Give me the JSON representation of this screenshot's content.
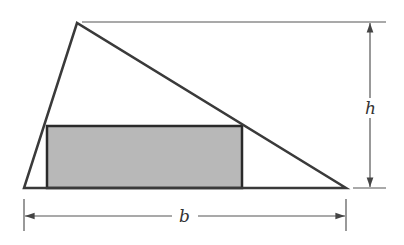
{
  "diagram": {
    "labels": {
      "height": "h",
      "base": "b"
    },
    "colors": {
      "stroke": "#3a3a3a",
      "thin_stroke": "#555555",
      "rect_fill": "#b8b8b8",
      "background": "#ffffff"
    },
    "triangle": {
      "apex": [
        77,
        23
      ],
      "bottom_left": [
        24,
        188
      ],
      "bottom_right": [
        346,
        188
      ]
    },
    "rectangle": {
      "x": 47,
      "y": 126,
      "width": 195,
      "height": 62
    }
  }
}
